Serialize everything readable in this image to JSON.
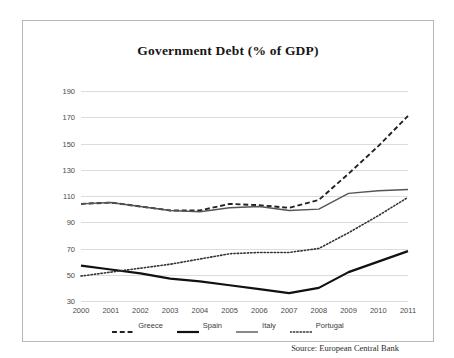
{
  "chart_data": {
    "type": "line",
    "title": "Government Debt (% of GDP)",
    "xlabel": "",
    "ylabel": "",
    "grid": true,
    "legend_position": "bottom",
    "ylim": [
      30,
      190
    ],
    "ytick_step": 20,
    "yticks": [
      "190",
      "170",
      "150",
      "130",
      "110",
      "90",
      "70",
      "50",
      "30"
    ],
    "categories": [
      "2000",
      "2001",
      "2002",
      "2003",
      "2004",
      "2005",
      "2006",
      "2007",
      "2008",
      "2009",
      "2010",
      "2011"
    ],
    "series": [
      {
        "name": "Greece",
        "style": "dashed",
        "color": "#222222",
        "width": 1.9,
        "values": [
          104,
          105,
          102,
          99,
          99,
          104,
          103,
          101,
          107,
          127,
          148,
          171
        ]
      },
      {
        "name": "Spain",
        "style": "solid-thick",
        "color": "#111111",
        "width": 2.2,
        "values": [
          57,
          54,
          51,
          47,
          45,
          42,
          39,
          36,
          40,
          52,
          60,
          68
        ]
      },
      {
        "name": "Italy",
        "style": "solid-thin",
        "color": "#555555",
        "width": 1.4,
        "values": [
          104,
          105,
          102,
          99,
          98,
          101,
          102,
          99,
          100,
          112,
          114,
          115
        ]
      },
      {
        "name": "Portugal",
        "style": "dotted",
        "color": "#333333",
        "width": 1.6,
        "values": [
          49,
          52,
          55,
          58,
          62,
          66,
          67,
          67,
          70,
          82,
          95,
          109
        ]
      }
    ],
    "source": "Source: European Central Bank"
  },
  "legend": {
    "items": [
      {
        "label": "Greece"
      },
      {
        "label": "Spain"
      },
      {
        "label": "Italy"
      },
      {
        "label": "Portugal"
      }
    ]
  }
}
